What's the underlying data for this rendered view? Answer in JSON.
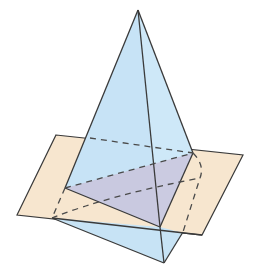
{
  "diagram": {
    "title": "",
    "colors": {
      "background": "#ffffff",
      "plane_fill": "#f7e6cf",
      "solid_fill": "#c7e3f5",
      "solid_fill_light": "#d8eefa",
      "cross_section_fill": "#c9c4dc",
      "edge_stroke": "#3a3a3a",
      "hidden_edge_stroke": "#4a4a4a"
    },
    "points": {
      "apex": [
        138,
        10
      ],
      "plane_tl": [
        56,
        135
      ],
      "plane_tr": [
        243,
        155
      ],
      "plane_br": [
        202,
        235
      ],
      "plane_bl": [
        17,
        215
      ],
      "sect_left": [
        65,
        188
      ],
      "sect_right": [
        193,
        153
      ],
      "sect_front": [
        160,
        227
      ],
      "base_left": [
        52,
        218
      ],
      "base_bottom": [
        164,
        263
      ],
      "base_right": [
        200,
        178
      ]
    },
    "labels": []
  }
}
